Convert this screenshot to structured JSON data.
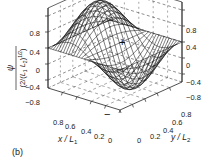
{
  "figure": {
    "panel_label": "(b)",
    "ylabel_num": "ψ",
    "ylabel_den": "(2/(L",
    "ylabel_den_full": "(2/(L1 L2)^(1/2)",
    "xlabel": "x / L",
    "xlabel_sub": "1",
    "ylabel2": "y / L",
    "ylabel2_sub": "2",
    "plus_sign": "+",
    "minus_sign": "−"
  },
  "chart_data": {
    "type": "surface3d",
    "title": "",
    "function": "psi = (2/(L1 L2)^(1/2)) * sin(2*pi*x/L1) * sin(pi*y/L2)",
    "xlabel": "x / L1",
    "ylabel": "y / L2",
    "zlabel": "ψ / (2/(L1 L2)^(1/2))",
    "x_ticks": [
      "0",
      "0.2",
      "0.4",
      "0.6",
      "0.8"
    ],
    "y_ticks": [
      "0",
      "0.2",
      "0.4",
      "0.6",
      "0.8"
    ],
    "z_ticks_left": [
      "0.8",
      "0.4",
      "0",
      "−0.4",
      "−0.8"
    ],
    "z_ticks_right": [
      "0.8",
      "0.4",
      "0",
      "−0.4",
      "−0.8"
    ],
    "xlim": [
      0,
      1
    ],
    "ylim": [
      0,
      1
    ],
    "zlim": [
      -1,
      1
    ],
    "annotations": [
      "+",
      "−"
    ],
    "grid": true
  }
}
